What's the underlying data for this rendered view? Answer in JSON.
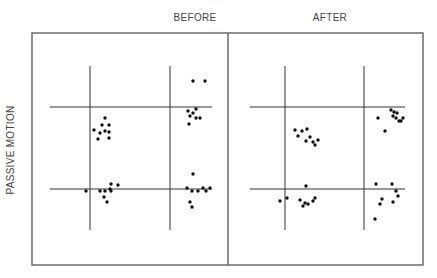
{
  "ylabel": "PASSIVE MOTION",
  "panels": [
    {
      "title": "BEFORE",
      "title_x": 195,
      "frame": {
        "x1": 32,
        "x2": 228
      },
      "vlines": [
        90,
        170
      ],
      "hlines": [
        107,
        189
      ],
      "hline_extent": [
        50,
        212
      ],
      "dots": [
        [
          105,
          118
        ],
        [
          102,
          125
        ],
        [
          109,
          125
        ],
        [
          94,
          130
        ],
        [
          100,
          133
        ],
        [
          105,
          131
        ],
        [
          109,
          132
        ],
        [
          98,
          139
        ],
        [
          109,
          138
        ],
        [
          193,
          81
        ],
        [
          205,
          81
        ],
        [
          188,
          111
        ],
        [
          193,
          113
        ],
        [
          196,
          109
        ],
        [
          190,
          116
        ],
        [
          196,
          118
        ],
        [
          200,
          118
        ],
        [
          189,
          124
        ],
        [
          86,
          191
        ],
        [
          100,
          191
        ],
        [
          105,
          191
        ],
        [
          110,
          189
        ],
        [
          111,
          184
        ],
        [
          118,
          185
        ],
        [
          104,
          197
        ],
        [
          107,
          202
        ],
        [
          111,
          191
        ],
        [
          193,
          174
        ],
        [
          187,
          188
        ],
        [
          192,
          191
        ],
        [
          198,
          191
        ],
        [
          203,
          188
        ],
        [
          206,
          191
        ],
        [
          210,
          188
        ],
        [
          190,
          202
        ],
        [
          192,
          207
        ]
      ]
    },
    {
      "title": "AFTER",
      "title_x": 330,
      "frame": {
        "x1": 228,
        "x2": 423
      },
      "vlines": [
        285,
        364
      ],
      "hlines": [
        107,
        189
      ],
      "hline_extent": [
        250,
        405
      ],
      "dots": [
        [
          295,
          130
        ],
        [
          298,
          136
        ],
        [
          302,
          131
        ],
        [
          307,
          129
        ],
        [
          306,
          141
        ],
        [
          310,
          137
        ],
        [
          313,
          142
        ],
        [
          315,
          145
        ],
        [
          318,
          140
        ],
        [
          391,
          110
        ],
        [
          394,
          112
        ],
        [
          397,
          113
        ],
        [
          393,
          116
        ],
        [
          396,
          118
        ],
        [
          399,
          121
        ],
        [
          401,
          121
        ],
        [
          403,
          118
        ],
        [
          378,
          118
        ],
        [
          385,
          131
        ],
        [
          306,
          186
        ],
        [
          287,
          198
        ],
        [
          280,
          201
        ],
        [
          300,
          200
        ],
        [
          305,
          203
        ],
        [
          303,
          206
        ],
        [
          308,
          204
        ],
        [
          313,
          201
        ],
        [
          315,
          198
        ],
        [
          376,
          184
        ],
        [
          392,
          184
        ],
        [
          396,
          191
        ],
        [
          398,
          196
        ],
        [
          382,
          199
        ],
        [
          380,
          204
        ],
        [
          393,
          202
        ],
        [
          375,
          219
        ]
      ]
    }
  ],
  "frame": {
    "top": 33,
    "bottom": 265,
    "left": 32,
    "right": 423
  },
  "vline_extent": [
    66,
    230
  ],
  "colors": {
    "line": "#333333",
    "dot": "#111111",
    "frame": "#555555"
  }
}
